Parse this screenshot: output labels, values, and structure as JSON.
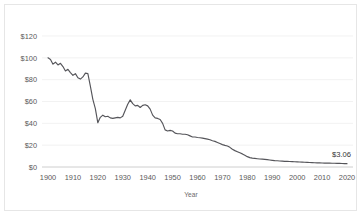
{
  "chart_data": {
    "type": "line",
    "title": "",
    "xlabel": "Year",
    "ylabel": "",
    "xlim": [
      1900,
      2020
    ],
    "ylim": [
      0,
      120
    ],
    "grid": true,
    "legend": false,
    "ytick_labels": [
      "$120",
      "$100",
      "$80",
      "$60",
      "$40",
      "$20",
      "$0"
    ],
    "ytick_values": [
      120,
      100,
      80,
      60,
      40,
      20,
      0
    ],
    "xtick_labels": [
      "1900",
      "1910",
      "1920",
      "1930",
      "1940",
      "1950",
      "1960",
      "1970",
      "1980",
      "1990",
      "2000",
      "2010",
      "2020"
    ],
    "xtick_values": [
      1900,
      1910,
      1920,
      1930,
      1940,
      1950,
      1960,
      1970,
      1980,
      1990,
      2000,
      2010,
      2020
    ],
    "line_color": "#55555a",
    "grid_color": "#ececec",
    "annotations": [
      {
        "text": "$3.06",
        "x": 2020,
        "y": 3.06
      }
    ],
    "series": [
      {
        "name": "Purchasing power of the US dollar",
        "x": [
          1900,
          1901,
          1902,
          1903,
          1904,
          1905,
          1906,
          1907,
          1908,
          1909,
          1910,
          1911,
          1912,
          1913,
          1914,
          1915,
          1916,
          1917,
          1918,
          1919,
          1920,
          1921,
          1922,
          1923,
          1924,
          1925,
          1926,
          1927,
          1928,
          1929,
          1930,
          1931,
          1932,
          1933,
          1934,
          1935,
          1936,
          1937,
          1938,
          1939,
          1940,
          1941,
          1942,
          1943,
          1944,
          1945,
          1946,
          1947,
          1948,
          1949,
          1950,
          1951,
          1952,
          1953,
          1954,
          1955,
          1956,
          1957,
          1958,
          1959,
          1960,
          1961,
          1962,
          1963,
          1964,
          1965,
          1966,
          1967,
          1968,
          1969,
          1970,
          1971,
          1972,
          1973,
          1974,
          1975,
          1976,
          1977,
          1978,
          1979,
          1980,
          1981,
          1982,
          1983,
          1984,
          1985,
          1986,
          1987,
          1988,
          1989,
          1990,
          1991,
          1992,
          1993,
          1994,
          1995,
          1996,
          1997,
          1998,
          1999,
          2000,
          2001,
          2002,
          2003,
          2004,
          2005,
          2006,
          2007,
          2008,
          2009,
          2010,
          2011,
          2012,
          2013,
          2014,
          2015,
          2016,
          2017,
          2018,
          2019,
          2020
        ],
        "values": [
          100.0,
          98.5,
          94.2,
          96.0,
          93.5,
          95.0,
          92.0,
          88.0,
          89.5,
          86.5,
          84.0,
          85.5,
          81.8,
          80.5,
          82.5,
          86.0,
          85.5,
          74.0,
          62.0,
          53.5,
          40.5,
          45.5,
          47.5,
          46.0,
          46.5,
          45.0,
          44.5,
          45.0,
          45.5,
          45.0,
          46.5,
          52.0,
          57.5,
          61.5,
          58.0,
          56.0,
          56.5,
          54.5,
          56.5,
          57.0,
          56.0,
          53.0,
          47.5,
          45.0,
          44.5,
          43.5,
          40.0,
          34.0,
          33.0,
          33.5,
          33.0,
          31.0,
          30.5,
          30.5,
          30.0,
          30.0,
          29.5,
          28.5,
          27.5,
          27.5,
          27.0,
          26.8,
          26.5,
          26.0,
          25.5,
          25.0,
          24.0,
          23.5,
          22.5,
          21.5,
          20.5,
          19.8,
          19.2,
          18.0,
          16.2,
          15.0,
          14.0,
          13.0,
          12.0,
          10.8,
          9.5,
          8.6,
          8.1,
          7.9,
          7.6,
          7.3,
          7.2,
          7.0,
          6.7,
          6.4,
          6.1,
          5.8,
          5.7,
          5.5,
          5.4,
          5.2,
          5.1,
          5.0,
          4.9,
          4.8,
          4.7,
          4.6,
          4.5,
          4.4,
          4.3,
          4.1,
          4.0,
          3.9,
          3.8,
          3.8,
          3.7,
          3.6,
          3.5,
          3.5,
          3.4,
          3.4,
          3.3,
          3.3,
          3.2,
          3.1,
          3.06
        ]
      }
    ]
  }
}
